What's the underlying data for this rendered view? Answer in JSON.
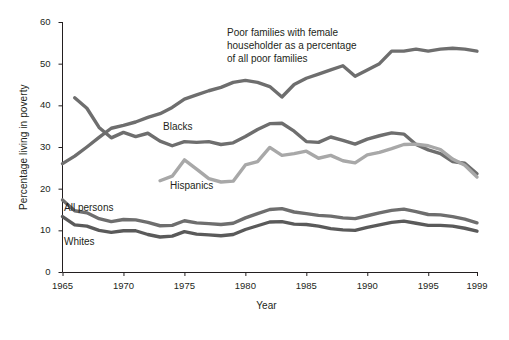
{
  "chart_data": {
    "type": "line",
    "title": "",
    "xlabel": "Year",
    "ylabel": "Percentage living in poverty",
    "xlim": [
      1965,
      1999
    ],
    "ylim": [
      0,
      60
    ],
    "xticks": [
      1965,
      1970,
      1975,
      1980,
      1985,
      1990,
      1995,
      1999
    ],
    "xtick_labels": [
      "1965",
      "1970",
      "1975",
      "1980",
      "1985",
      "1990",
      "1995",
      "1999"
    ],
    "yticks": [
      0,
      10,
      20,
      30,
      40,
      50,
      60
    ],
    "ytick_labels": [
      "0",
      "10",
      "20",
      "30",
      "40",
      "50",
      "60"
    ],
    "grid": false,
    "legend_position": "inline-annotations",
    "series": [
      {
        "name": "Poor families with female householder as a percentage of all poor families",
        "label_text": "Poor families with female\nhouseholder as a percentage\nof all poor families",
        "color": "#6e6e6e",
        "x": [
          1965,
          1966,
          1967,
          1968,
          1969,
          1970,
          1971,
          1972,
          1973,
          1974,
          1975,
          1976,
          1977,
          1978,
          1979,
          1980,
          1981,
          1982,
          1983,
          1984,
          1985,
          1986,
          1987,
          1988,
          1989,
          1990,
          1991,
          1992,
          1993,
          1994,
          1995,
          1996,
          1997,
          1998,
          1999
        ],
        "values": [
          26.0,
          27.8,
          30.0,
          32.3,
          34.5,
          35.2,
          36.0,
          37.1,
          38.0,
          39.5,
          41.5,
          42.5,
          43.5,
          44.3,
          45.5,
          46.0,
          45.5,
          44.5,
          42.0,
          45.0,
          46.5,
          47.5,
          48.5,
          49.5,
          47.0,
          48.5,
          50.0,
          53.0,
          53.0,
          53.5,
          53.0,
          53.5,
          53.7,
          53.5,
          53.0
        ]
      },
      {
        "name": "Blacks",
        "label_text": "Blacks",
        "color": "#6e6e6e",
        "x": [
          1966,
          1967,
          1968,
          1969,
          1970,
          1971,
          1972,
          1973,
          1974,
          1975,
          1976,
          1977,
          1978,
          1979,
          1980,
          1981,
          1982,
          1983,
          1984,
          1985,
          1986,
          1987,
          1988,
          1989,
          1990,
          1991,
          1992,
          1993,
          1994,
          1995,
          1996,
          1997,
          1998,
          1999
        ],
        "values": [
          41.8,
          39.3,
          34.7,
          32.2,
          33.5,
          32.5,
          33.3,
          31.4,
          30.3,
          31.3,
          31.1,
          31.3,
          30.6,
          31.0,
          32.5,
          34.2,
          35.6,
          35.7,
          33.8,
          31.3,
          31.1,
          32.4,
          31.6,
          30.7,
          31.9,
          32.7,
          33.4,
          33.1,
          30.6,
          29.3,
          28.4,
          26.5,
          26.1,
          23.6
        ]
      },
      {
        "name": "Hispanics",
        "label_text": "Hispanics",
        "color": "#a8a8a8",
        "x": [
          1973,
          1974,
          1975,
          1976,
          1977,
          1978,
          1979,
          1980,
          1981,
          1982,
          1983,
          1984,
          1985,
          1986,
          1987,
          1988,
          1989,
          1990,
          1991,
          1992,
          1993,
          1994,
          1995,
          1996,
          1997,
          1998,
          1999
        ],
        "values": [
          21.9,
          23.0,
          26.9,
          24.7,
          22.4,
          21.6,
          21.8,
          25.7,
          26.5,
          29.9,
          28.0,
          28.4,
          29.0,
          27.3,
          28.0,
          26.7,
          26.2,
          28.1,
          28.7,
          29.6,
          30.6,
          30.7,
          30.3,
          29.4,
          27.1,
          25.6,
          22.8
        ]
      },
      {
        "name": "All persons",
        "label_text": "All persons",
        "color": "#6e6e6e",
        "x": [
          1965,
          1966,
          1967,
          1968,
          1969,
          1970,
          1971,
          1972,
          1973,
          1974,
          1975,
          1976,
          1977,
          1978,
          1979,
          1980,
          1981,
          1982,
          1983,
          1984,
          1985,
          1986,
          1987,
          1988,
          1989,
          1990,
          1991,
          1992,
          1993,
          1994,
          1995,
          1996,
          1997,
          1998,
          1999
        ],
        "values": [
          17.3,
          14.7,
          14.2,
          12.8,
          12.1,
          12.6,
          12.5,
          11.9,
          11.1,
          11.2,
          12.3,
          11.8,
          11.6,
          11.4,
          11.7,
          13.0,
          14.0,
          15.0,
          15.2,
          14.4,
          14.0,
          13.6,
          13.4,
          13.0,
          12.8,
          13.5,
          14.2,
          14.8,
          15.1,
          14.5,
          13.8,
          13.7,
          13.3,
          12.7,
          11.8
        ]
      },
      {
        "name": "Whites",
        "label_text": "Whites",
        "color": "#5a5a5a",
        "x": [
          1965,
          1966,
          1967,
          1968,
          1969,
          1970,
          1971,
          1972,
          1973,
          1974,
          1975,
          1976,
          1977,
          1978,
          1979,
          1980,
          1981,
          1982,
          1983,
          1984,
          1985,
          1986,
          1987,
          1988,
          1989,
          1990,
          1991,
          1992,
          1993,
          1994,
          1995,
          1996,
          1997,
          1998,
          1999
        ],
        "values": [
          13.3,
          11.3,
          11.0,
          10.0,
          9.5,
          9.9,
          9.9,
          9.0,
          8.4,
          8.6,
          9.7,
          9.1,
          8.9,
          8.7,
          9.0,
          10.2,
          11.1,
          12.0,
          12.1,
          11.5,
          11.4,
          11.0,
          10.4,
          10.1,
          10.0,
          10.7,
          11.3,
          11.9,
          12.2,
          11.7,
          11.2,
          11.2,
          11.0,
          10.5,
          9.8
        ]
      }
    ]
  },
  "labels": {
    "annotation_top_line1": "Poor families with female",
    "annotation_top_line2": "householder as a percentage",
    "annotation_top_line3": "of all poor families",
    "blacks": "Blacks",
    "hispanics": "Hispanics",
    "all_persons": "All persons",
    "whites": "Whites"
  },
  "axes": {
    "x_title": "Year",
    "y_title": "Percentage living in poverty"
  },
  "colors": {
    "axis": "#231f20",
    "dark_line": "#6e6e6e",
    "light_line": "#a8a8a8",
    "darkest_line": "#5a5a5a",
    "background": "#ffffff",
    "text": "#231f20"
  }
}
